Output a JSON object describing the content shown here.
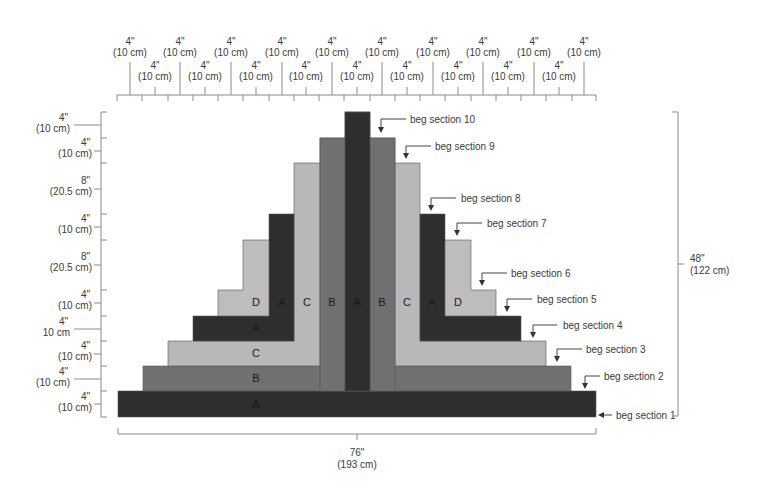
{
  "colors": {
    "A": "#2e2e2e",
    "B": "#707070",
    "C": "#b8b8b8",
    "D": "#bdbdbd",
    "line": "#8a8a8a",
    "text": "#3a3a3a"
  },
  "top_ruler": {
    "upper_labels": [
      {
        "in": "4\"",
        "cm": "(10 cm)"
      },
      {
        "in": "4\"",
        "cm": "(10 cm)"
      },
      {
        "in": "4\"",
        "cm": "(10 cm)"
      },
      {
        "in": "4\"",
        "cm": "(10 cm)"
      },
      {
        "in": "4\"",
        "cm": "(10 cm)"
      },
      {
        "in": "4\"",
        "cm": "(10 cm)"
      },
      {
        "in": "4\"",
        "cm": "(10 cm)"
      },
      {
        "in": "4\"",
        "cm": "(10 cm)"
      },
      {
        "in": "4\"",
        "cm": "(10 cm)"
      },
      {
        "in": "4\"",
        "cm": "(10 cm)"
      }
    ],
    "lower_labels": [
      {
        "in": "4\"",
        "cm": "(10 cm)"
      },
      {
        "in": "4\"",
        "cm": "(10 cm)"
      },
      {
        "in": "4\"",
        "cm": "(10 cm)"
      },
      {
        "in": "4\"",
        "cm": "(10 cm)"
      },
      {
        "in": "4\"",
        "cm": "(10 cm)"
      },
      {
        "in": "4\"",
        "cm": "(10 cm)"
      },
      {
        "in": "4\"",
        "cm": "(10 cm)"
      },
      {
        "in": "4\"",
        "cm": "(10 cm)"
      },
      {
        "in": "4\"",
        "cm": "(10 cm)"
      }
    ]
  },
  "left_ruler": {
    "labels": [
      {
        "in": "4\"",
        "cm": "(10 cm)"
      },
      {
        "in": "4\"",
        "cm": "(10 cm)"
      },
      {
        "in": "8\"",
        "cm": "(20.5 cm)"
      },
      {
        "in": "4\"",
        "cm": "(10 cm)"
      },
      {
        "in": "8\"",
        "cm": "(20.5 cm)"
      },
      {
        "in": "4\"",
        "cm": "(10 cm)"
      },
      {
        "in": "4\"",
        "cm": "10 cm"
      },
      {
        "in": "4\"",
        "cm": "(10 cm)"
      },
      {
        "in": "4\"",
        "cm": "(10 cm)"
      },
      {
        "in": "4\"",
        "cm": "(10 cm)"
      }
    ]
  },
  "width_dimension": {
    "in": "76\"",
    "cm": "(193 cm)"
  },
  "height_dimension": {
    "in": "48\"",
    "cm": "(122 cm)"
  },
  "block_letters": {
    "row1": "A",
    "row2": "B",
    "row3": "C",
    "row4": "A",
    "row5_left_d": "D",
    "row5_left_a": "A",
    "col_c_left": "C",
    "col_b_left": "B",
    "col_a_center": "A",
    "col_b_right": "B",
    "col_c_right": "C",
    "col_a_right": "A",
    "col_d_right": "D"
  },
  "callouts": [
    "beg section 1",
    "beg section 2",
    "beg section 3",
    "beg section 4",
    "beg section 5",
    "beg section 6",
    "beg section 7",
    "beg section 8",
    "beg section 9",
    "beg section 10"
  ]
}
